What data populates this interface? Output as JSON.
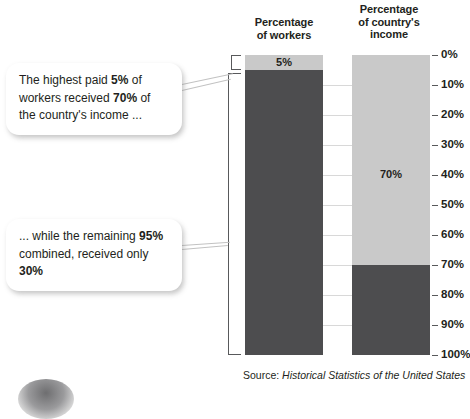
{
  "headers": {
    "workers": "Percentage\nof workers",
    "income": "Percentage\nof country's\nincome"
  },
  "callouts": {
    "top": {
      "t1": "The highest paid ",
      "b1": "5%",
      "t2": " of workers received ",
      "b2": "70%",
      "t3": " of the country's income ..."
    },
    "bottom": {
      "t1": "... while the remaining ",
      "b1": "95%",
      "t2": " combined, received only ",
      "b2": "30%",
      "t3": ""
    }
  },
  "source": {
    "prefix": "Source: ",
    "title": "Historical Statistics of the United States"
  },
  "colors": {
    "dark": "#4d4d4f",
    "light": "#c9c9c9",
    "axis": "#58595b",
    "grid": "#d8d8d8",
    "text": "#231f20"
  },
  "chart_data": {
    "type": "bar",
    "subtitle": "",
    "xlabel": "",
    "ylabel": "",
    "ylim": [
      0,
      100
    ],
    "y_axis_inverted": true,
    "grid": true,
    "legend": "none",
    "tick_labels": [
      "0%",
      "10%",
      "20%",
      "30%",
      "40%",
      "50%",
      "60%",
      "70%",
      "80%",
      "90%",
      "100%"
    ],
    "tick_values": [
      0,
      10,
      20,
      30,
      40,
      50,
      60,
      70,
      80,
      90,
      100
    ],
    "categories": [
      "Percentage of workers",
      "Percentage of country's income"
    ],
    "series": [
      {
        "name": "Highest paid group",
        "shade": "light",
        "values": [
          5,
          70
        ],
        "labels": [
          "5%",
          "70%"
        ],
        "label_shown": [
          true,
          true
        ]
      },
      {
        "name": "Remaining group",
        "shade": "dark",
        "values": [
          95,
          30
        ],
        "labels": [
          "95%",
          "30%"
        ],
        "label_shown": [
          false,
          false
        ]
      }
    ],
    "bars": [
      {
        "category": "Percentage of workers",
        "segments": [
          {
            "name": "highest paid 5%",
            "shade": "light",
            "start": 0,
            "end": 5,
            "label": "5%",
            "label_shown": true
          },
          {
            "name": "remaining 95%",
            "shade": "dark",
            "start": 5,
            "end": 100,
            "label": "95%",
            "label_shown": false
          }
        ]
      },
      {
        "category": "Percentage of country's income",
        "segments": [
          {
            "name": "income to top 5%",
            "shade": "light",
            "start": 0,
            "end": 70,
            "label": "70%",
            "label_shown": true,
            "label_at": 40
          },
          {
            "name": "income to other 95%",
            "shade": "dark",
            "start": 70,
            "end": 100,
            "label": "30%",
            "label_shown": false
          }
        ]
      }
    ],
    "annotations": [
      {
        "name": "bracket-top",
        "spans": [
          0,
          5
        ],
        "target": "Percentage of workers"
      },
      {
        "name": "bracket-bottom",
        "spans": [
          5,
          100
        ],
        "target": "Percentage of workers"
      }
    ]
  }
}
